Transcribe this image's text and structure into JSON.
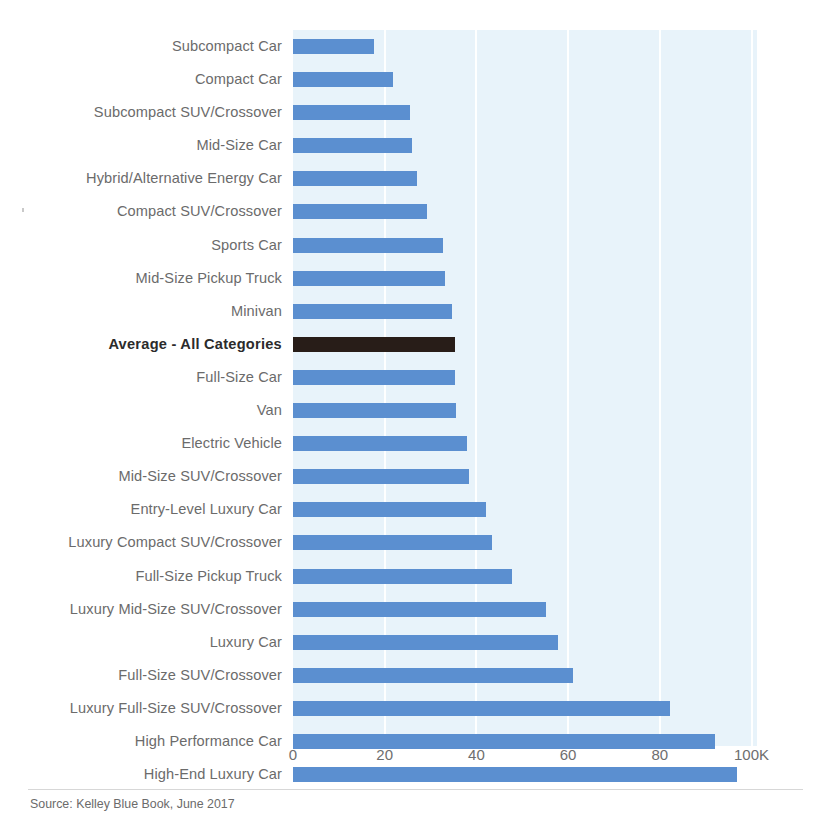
{
  "source_note": "Source: Kelley Blue Book, June 2017",
  "axis": {
    "ticks": [
      {
        "label": "0",
        "value": 0
      },
      {
        "label": "20",
        "value": 20
      },
      {
        "label": "40",
        "value": 40
      },
      {
        "label": "60",
        "value": 60
      },
      {
        "label": "80",
        "value": 80
      },
      {
        "label": "100K",
        "value": 100
      }
    ]
  },
  "colors": {
    "bar": "#5b8fd0",
    "highlight_bar": "#281d18",
    "plot_background": "#e8f3fa",
    "gridline": "#ffffff",
    "label_text": "#6b6b6b",
    "highlight_text": "#2b2b2b"
  },
  "chart_data": {
    "type": "bar",
    "orientation": "horizontal",
    "title": "",
    "subtitle": "",
    "xlabel": "",
    "ylabel": "",
    "xlim": [
      0,
      100
    ],
    "grid": true,
    "legend": "none",
    "unit": "thousands of USD",
    "categories": [
      "Subcompact Car",
      "Compact Car",
      "Subcompact SUV/Crossover",
      "Mid-Size Car",
      "Hybrid/Alternative Energy Car",
      "Compact SUV/Crossover",
      "Sports Car",
      "Mid-Size Pickup Truck",
      "Minivan",
      "Average - All Categories",
      "Full-Size Car",
      "Van",
      "Electric Vehicle",
      "Mid-Size SUV/Crossover",
      "Entry-Level Luxury Car",
      "Luxury Compact SUV/Crossover",
      "Full-Size Pickup Truck",
      "Luxury Mid-Size SUV/Crossover",
      "Luxury Car",
      "Full-Size SUV/Crossover",
      "Luxury Full-Size SUV/Crossover",
      "High Performance Car",
      "High-End Luxury Car"
    ],
    "values": [
      17.7,
      21.8,
      25.5,
      25.9,
      27.0,
      29.2,
      32.7,
      33.2,
      34.6,
      35.3,
      35.4,
      35.6,
      38.0,
      38.4,
      42.1,
      43.4,
      47.8,
      55.2,
      57.8,
      61.1,
      82.2,
      92.0,
      96.8
    ],
    "highlight_index": 9
  }
}
